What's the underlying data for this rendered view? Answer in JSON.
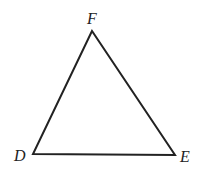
{
  "diagram": {
    "type": "triangle",
    "stroke_color": "#222222",
    "vertices": [
      {
        "name": "F",
        "x": 92,
        "y": 31
      },
      {
        "name": "D",
        "x": 33,
        "y": 154
      },
      {
        "name": "E",
        "x": 175,
        "y": 155
      }
    ],
    "labels": {
      "F": "F",
      "D": "D",
      "E": "E"
    }
  }
}
